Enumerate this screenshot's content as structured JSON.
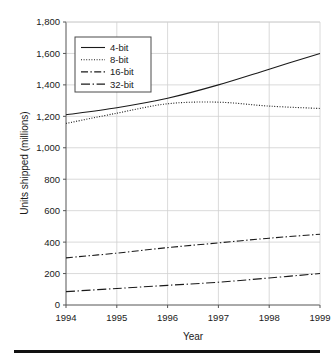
{
  "chart_data": {
    "type": "line",
    "title": "",
    "xlabel": "Year",
    "ylabel": "Units shipped (millions)",
    "categories": [
      "1994",
      "1995",
      "1996",
      "1997",
      "1998",
      "1999"
    ],
    "x": [
      1994,
      1995,
      1996,
      1997,
      1998,
      1999
    ],
    "xlim": [
      1994,
      1999
    ],
    "ylim": [
      0,
      1800
    ],
    "yticks": [
      "0",
      "200",
      "400",
      "600",
      "800",
      "1,000",
      "1,200",
      "1,400",
      "1,600",
      "1,800"
    ],
    "ytick_values": [
      0,
      200,
      400,
      600,
      800,
      1000,
      1200,
      1400,
      1600,
      1800
    ],
    "xticks": [
      "1994",
      "1995",
      "1996",
      "1997",
      "1998",
      "1999"
    ],
    "grid": true,
    "legend_position": "upper-left-inside",
    "series": [
      {
        "name": "4-bit",
        "style": "solid",
        "color": "#1a1a1a",
        "values": [
          1210,
          1255,
          1315,
          1400,
          1500,
          1600
        ]
      },
      {
        "name": "8-bit",
        "style": "dotted",
        "color": "#1a1a1a",
        "values": [
          1155,
          1220,
          1280,
          1290,
          1265,
          1250
        ]
      },
      {
        "name": "16-bit",
        "style": "dash-dot",
        "color": "#1a1a1a",
        "values": [
          300,
          330,
          365,
          395,
          425,
          450
        ]
      },
      {
        "name": "32-bit",
        "style": "long-dash-dot",
        "color": "#1a1a1a",
        "values": [
          85,
          105,
          125,
          145,
          172,
          200
        ]
      }
    ]
  },
  "figure": {
    "axis_color": "#555555",
    "grid_color": "#d0d0d0",
    "rule_color": "#111111"
  }
}
